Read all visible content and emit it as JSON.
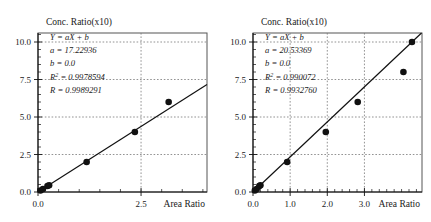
{
  "figure": {
    "panels": [
      {
        "id": "left",
        "ylabel": "Conc. Ratio(x10)",
        "xlabel": "Area Ratio",
        "annotation": {
          "equation": "Y = aX + b",
          "a": "a = 17.22936",
          "b": "b = 0.0",
          "r2": "R 2 = 0.9978594",
          "r": "R = 0.9989291"
        },
        "chart_data": {
          "type": "scatter",
          "title": "",
          "xlabel": "Area Ratio",
          "ylabel": "Conc. Ratio(x10)",
          "xlim": [
            0.0,
            4.1
          ],
          "ylim": [
            0.0,
            10.6
          ],
          "xticks": [
            0.0,
            2.5
          ],
          "xtick_labels": [
            "0.0",
            "2.5"
          ],
          "yticks": [
            0.0,
            2.5,
            5.0,
            7.5,
            10.0
          ],
          "ytick_labels": [
            "0.0",
            "2.5",
            "5.0",
            "7.5",
            "10.0"
          ],
          "grid": true,
          "legend": "none",
          "fit": {
            "slope": 17.22936,
            "intercept": 0.0,
            "r_squared": 0.9978594,
            "r": 0.9989291
          },
          "points_x": [
            0.06,
            0.12,
            0.23,
            0.27,
            1.18,
            2.35,
            3.17,
            4.45,
            5.72
          ],
          "points_y": [
            0.1,
            0.2,
            0.4,
            0.45,
            2.0,
            4.0,
            6.0,
            8.0,
            10.0
          ],
          "x": [
            0.06,
            0.12,
            0.23,
            0.27,
            1.18,
            2.35,
            3.17,
            4.45,
            5.72
          ],
          "values": [
            0.1,
            0.2,
            0.4,
            0.45,
            2.0,
            4.0,
            6.0,
            8.0,
            10.0
          ]
        }
      },
      {
        "id": "right",
        "ylabel": "Conc. Ratio(x10)",
        "xlabel": "Area Ratio",
        "annotation": {
          "equation": "Y = aX + b",
          "a": "a = 20.53369",
          "b": "b = 0.0",
          "r2": "R 2 = 0.990072",
          "r": "R = 0.9932760"
        },
        "chart_data": {
          "type": "scatter",
          "title": "",
          "xlabel": "Area Ratio",
          "ylabel": "Conc. Ratio(x10)",
          "xlim": [
            0.0,
            4.55
          ],
          "ylim": [
            0.0,
            10.6
          ],
          "xticks": [
            0.0,
            1.0,
            2.0,
            3.0
          ],
          "xtick_labels": [
            "0.0",
            "1.0",
            "2.0",
            "3.0"
          ],
          "yticks": [
            0.0,
            2.5,
            5.0,
            7.5,
            10.0
          ],
          "ytick_labels": [
            "0.0",
            "2.5",
            "5.0",
            "7.5",
            "10.0"
          ],
          "grid": true,
          "legend": "none",
          "fit": {
            "slope": 20.53369,
            "intercept": 0.0,
            "r_squared": 0.990072,
            "r": 0.993276
          },
          "points_x": [
            0.05,
            0.1,
            0.17,
            0.2,
            0.92,
            1.96,
            2.82,
            4.05,
            4.28
          ],
          "points_y": [
            0.1,
            0.2,
            0.4,
            0.45,
            2.0,
            4.0,
            6.0,
            8.0,
            10.0
          ],
          "x": [
            0.05,
            0.1,
            0.17,
            0.2,
            0.92,
            1.96,
            2.82,
            4.05,
            4.28
          ],
          "values": [
            0.1,
            0.2,
            0.4,
            0.45,
            2.0,
            4.0,
            6.0,
            8.0,
            10.0
          ]
        }
      }
    ]
  }
}
